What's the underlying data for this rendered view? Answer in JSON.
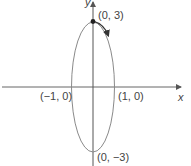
{
  "diagram": {
    "type": "parametric-ellipse",
    "center": [
      0,
      0
    ],
    "semi_axis_x": 1,
    "semi_axis_y": 3,
    "orientation": "clockwise",
    "start_point": "(0, 3)",
    "axes": {
      "x_label": "x",
      "y_label": "y"
    },
    "points": [
      {
        "label": "(0, 3)",
        "x": 0,
        "y": 3
      },
      {
        "label": "(1, 0)",
        "x": 1,
        "y": 0
      },
      {
        "label": "(-1, 0)",
        "display": "(−1, 0)",
        "x": -1,
        "y": 0
      },
      {
        "label": "(0, -3)",
        "display": "(0, −3)",
        "x": 0,
        "y": -3
      }
    ],
    "colors": {
      "curve": "#8a8a8a",
      "axes": "#555555",
      "arrow": "#333333"
    }
  },
  "labels": {
    "top": "(0, 3)",
    "right": "(1, 0)",
    "left": "(−1, 0)",
    "bottom": "(0, −3)",
    "x_axis": "x",
    "y_axis": "y"
  }
}
